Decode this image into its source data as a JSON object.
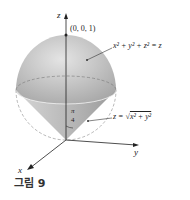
{
  "figure": {
    "caption": "그림 9",
    "axes": {
      "x": "x",
      "y": "y",
      "z": "z"
    },
    "point_label": "(0, 0, 1)",
    "sphere_equation": "x² + y² + z² = z",
    "cone_equation_lhs": "z = ",
    "cone_equation_radicand": "x² + y²",
    "angle_numerator": "π",
    "angle_denominator": "4",
    "colors": {
      "sphere": "#c8c8c8",
      "cone": "#b0b0b0",
      "axis": "#222222"
    }
  }
}
